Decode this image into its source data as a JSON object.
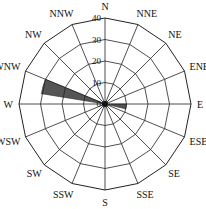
{
  "chart_data": {
    "type": "wind-rose",
    "title": "",
    "directions": [
      "N",
      "NNE",
      "NE",
      "ENE",
      "E",
      "ESE",
      "SE",
      "SSE",
      "S",
      "SSW",
      "SW",
      "WSW",
      "W",
      "WNW",
      "NW",
      "NNW"
    ],
    "values": [
      0,
      0,
      0,
      0,
      10,
      0,
      0,
      0,
      0,
      0,
      0,
      0,
      0,
      30,
      0,
      0
    ],
    "radial_ticks": [
      "0",
      "10",
      "20",
      "30",
      "40"
    ],
    "radial_range": [
      0,
      40
    ],
    "grid": true,
    "bar_color": "#555555"
  }
}
